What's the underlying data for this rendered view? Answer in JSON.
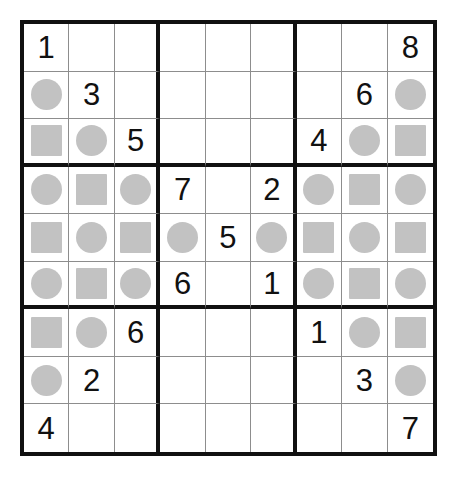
{
  "puzzle": {
    "type": "sudoku-variant-grid",
    "size": 9,
    "box_rows": 3,
    "box_cols": 3,
    "colors": {
      "grid_line_thin": "#8d8d8d",
      "grid_line_thick": "#111111",
      "shape_fill": "#c2c2c2",
      "digit": "#111111",
      "background": "#ffffff"
    },
    "legend": {
      "circle": "circle",
      "square": "square",
      "empty": ""
    },
    "grid": [
      [
        "1",
        "",
        "",
        "",
        "",
        "",
        "",
        "",
        "8"
      ],
      [
        "circle",
        "3",
        "",
        "",
        "",
        "",
        "",
        "6",
        "circle"
      ],
      [
        "square",
        "circle",
        "5",
        "",
        "",
        "",
        "4",
        "circle",
        "square"
      ],
      [
        "circle",
        "square",
        "circle",
        "7",
        "",
        "2",
        "circle",
        "square",
        "circle"
      ],
      [
        "square",
        "circle",
        "square",
        "circle",
        "5",
        "circle",
        "square",
        "circle",
        "square"
      ],
      [
        "circle",
        "square",
        "circle",
        "6",
        "",
        "1",
        "circle",
        "square",
        "circle"
      ],
      [
        "square",
        "circle",
        "6",
        "",
        "",
        "",
        "1",
        "circle",
        "square"
      ],
      [
        "circle",
        "2",
        "",
        "",
        "",
        "",
        "",
        "3",
        "circle"
      ],
      [
        "4",
        "",
        "",
        "",
        "",
        "",
        "",
        "",
        "7"
      ]
    ],
    "given_digits": [
      {
        "row": 1,
        "col": 1,
        "value": "1"
      },
      {
        "row": 1,
        "col": 9,
        "value": "8"
      },
      {
        "row": 2,
        "col": 2,
        "value": "3"
      },
      {
        "row": 2,
        "col": 8,
        "value": "6"
      },
      {
        "row": 3,
        "col": 3,
        "value": "5"
      },
      {
        "row": 3,
        "col": 7,
        "value": "4"
      },
      {
        "row": 4,
        "col": 4,
        "value": "7"
      },
      {
        "row": 4,
        "col": 6,
        "value": "2"
      },
      {
        "row": 5,
        "col": 5,
        "value": "5"
      },
      {
        "row": 6,
        "col": 4,
        "value": "6"
      },
      {
        "row": 6,
        "col": 6,
        "value": "1"
      },
      {
        "row": 7,
        "col": 3,
        "value": "6"
      },
      {
        "row": 7,
        "col": 7,
        "value": "1"
      },
      {
        "row": 8,
        "col": 2,
        "value": "2"
      },
      {
        "row": 8,
        "col": 8,
        "value": "3"
      },
      {
        "row": 9,
        "col": 1,
        "value": "4"
      },
      {
        "row": 9,
        "col": 9,
        "value": "7"
      }
    ]
  }
}
